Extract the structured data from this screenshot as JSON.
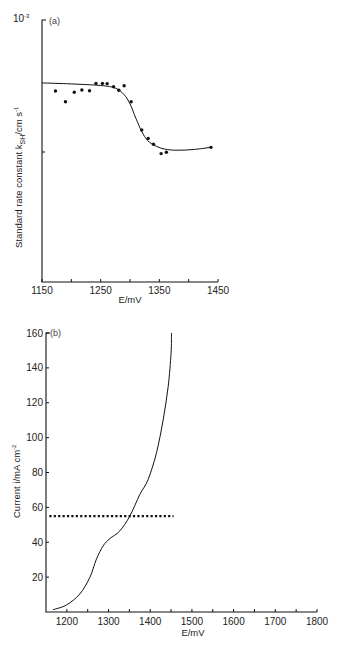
{
  "chart_data": [
    {
      "panel": "(a)",
      "type": "scatter",
      "title": "",
      "xlabel": "E/mV",
      "ylabel": "Standard rate constant  k_SH/cm s^-1",
      "ylabel_main": "Standard rate constant  k",
      "ylabel_sub": "SH",
      "ylabel_tail": "/cm s",
      "ylabel_sup": "-1",
      "y_top_label": "10",
      "y_top_sup": "-3",
      "xlim": [
        1150,
        1450
      ],
      "xticks": [
        1150,
        1200,
        1250,
        1300,
        1350,
        1400,
        1450
      ],
      "xtick_labels": [
        "1150",
        "1250",
        "1350",
        "1450"
      ],
      "ylim_note": "top of axis = 10^-3; one unlabeled intermediate tick",
      "y_units_note": "values below given as fraction of axis height x10 (top = 10)",
      "ylim": [
        0,
        10
      ],
      "grid": false,
      "series": [
        {
          "name": "measured",
          "style": "points",
          "x": [
            1173,
            1190,
            1205,
            1218,
            1231,
            1242,
            1253,
            1261,
            1272,
            1281,
            1290,
            1302,
            1320,
            1331,
            1340,
            1353,
            1362,
            1438
          ],
          "y": [
            7.29,
            6.88,
            7.24,
            7.33,
            7.3,
            7.58,
            7.58,
            7.57,
            7.45,
            7.32,
            7.49,
            6.88,
            5.8,
            5.48,
            5.26,
            4.9,
            4.95,
            5.14
          ]
        },
        {
          "name": "fit",
          "style": "line",
          "x": [
            1150,
            1200,
            1250,
            1275,
            1290,
            1300,
            1310,
            1320,
            1330,
            1345,
            1360,
            1380,
            1410,
            1438
          ],
          "y": [
            7.6,
            7.56,
            7.5,
            7.4,
            7.15,
            6.8,
            6.25,
            5.75,
            5.4,
            5.18,
            5.07,
            5.03,
            5.06,
            5.14
          ]
        }
      ]
    },
    {
      "panel": "(b)",
      "type": "line",
      "title": "",
      "xlabel": "E/mV",
      "ylabel": "Current i/mA cm^-2",
      "ylabel_main": "Current i/mA cm",
      "ylabel_sup": "-2",
      "xlim": [
        1150,
        1800
      ],
      "xticks": [
        1200,
        1250,
        1300,
        1350,
        1400,
        1450,
        1500,
        1550,
        1600,
        1650,
        1700,
        1750,
        1800
      ],
      "xtick_labels": [
        "1200",
        "1300",
        "1400",
        "1500",
        "1600",
        "1700",
        "1800"
      ],
      "ylim": [
        0,
        160
      ],
      "yticks": [
        20,
        40,
        60,
        80,
        100,
        120,
        140,
        160
      ],
      "ytick_labels": [
        "20",
        "40",
        "60",
        "80",
        "100",
        "120",
        "140",
        "160"
      ],
      "grid": false,
      "series": [
        {
          "name": "current",
          "style": "line",
          "x": [
            1167,
            1199,
            1231,
            1255,
            1271,
            1287,
            1303,
            1327,
            1351,
            1375,
            1395,
            1415,
            1431,
            1443,
            1450,
            1451
          ],
          "y": [
            1.3,
            4.0,
            10.3,
            19.8,
            30.3,
            37.9,
            42.1,
            46.5,
            55.0,
            67.4,
            76.0,
            91.3,
            110.3,
            129.3,
            148.6,
            160.0
          ]
        },
        {
          "name": "constant level",
          "style": "dotted",
          "x": [
            1158,
            1456
          ],
          "y": [
            55,
            55
          ]
        }
      ]
    }
  ]
}
